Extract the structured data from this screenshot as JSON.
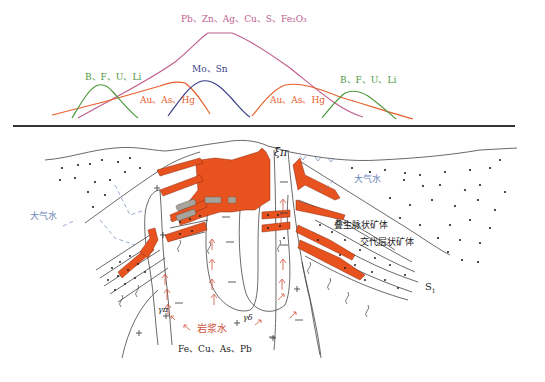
{
  "diagram": {
    "colors": {
      "pb_zn_curve": "#c0608e",
      "au_as_hg_curve": "#e8602e",
      "b_f_u_li_curve": "#4e9a3e",
      "mo_sn_curve": "#3a3f8a",
      "ore_fill": "#e8521e",
      "gray_fill": "#a8a49c",
      "water_label": "#6a86b8",
      "magma_label": "#d0503a",
      "line": "#444444",
      "separator": "#333333"
    },
    "profile": {
      "curves": [
        {
          "id": "pb_zn",
          "label": "Pb、Zn、Ag、Cu、S、Fe₂O₃",
          "color": "#c0608e"
        },
        {
          "id": "b_f_u_li_left",
          "label": "B、F、U、Li",
          "color": "#4e9a3e"
        },
        {
          "id": "mo_sn",
          "label": "Mo、Sn",
          "color": "#3a3f8a"
        },
        {
          "id": "au_as_hg_left",
          "label": "Au、As、Hg",
          "color": "#e8602e"
        },
        {
          "id": "au_as_hg_right",
          "label": "Au、As、Hg",
          "color": "#e8602e"
        },
        {
          "id": "b_f_u_li_right",
          "label": "B、F、U、Li",
          "color": "#4e9a3e"
        }
      ]
    },
    "section": {
      "labels": {
        "xi_pi": "ξπ",
        "gamma_pi": "γπ",
        "gamma_delta": "γδ",
        "s1_main": "S",
        "s1_sub": "1",
        "meteoric_water_left": "大气水",
        "meteoric_water_right": "大气水",
        "superimposed_vein_orebody": "叠生脉状矿体",
        "replacement_stratiform_orebody": "交代层状矿体",
        "magmatic_water": "岩浆水",
        "deep_elements": "Fe、Cu、As、Pb"
      }
    }
  }
}
